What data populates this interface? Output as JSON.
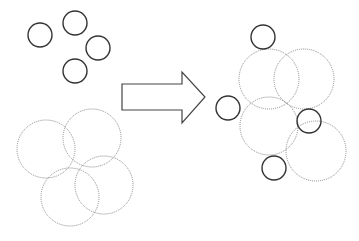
{
  "diagram": {
    "width": 359,
    "height": 241,
    "colors": {
      "background": "#ffffff",
      "solid_stroke": "#333333",
      "dotted_stroke": "#8a8a8a",
      "arrow_stroke": "#444444"
    },
    "left_group": {
      "small_circles": [
        {
          "cx": 40,
          "cy": 35,
          "r": 12
        },
        {
          "cx": 75,
          "cy": 23,
          "r": 12
        },
        {
          "cx": 98,
          "cy": 48,
          "r": 12
        },
        {
          "cx": 75,
          "cy": 71,
          "r": 12
        }
      ],
      "large_dotted_circles": [
        {
          "cx": 46,
          "cy": 149,
          "r": 29
        },
        {
          "cx": 92,
          "cy": 138,
          "r": 29
        },
        {
          "cx": 70,
          "cy": 197,
          "r": 29
        },
        {
          "cx": 104,
          "cy": 185,
          "r": 29
        }
      ]
    },
    "arrow": {
      "points": "122,84 182,84 182,72 205,97 182,123 182,110 122,110"
    },
    "right_group": {
      "small_circles": [
        {
          "cx": 263,
          "cy": 37,
          "r": 12
        },
        {
          "cx": 228,
          "cy": 108,
          "r": 12
        },
        {
          "cx": 309,
          "cy": 121,
          "r": 12
        },
        {
          "cx": 274,
          "cy": 168,
          "r": 12
        }
      ],
      "large_dotted_circles": [
        {
          "cx": 269,
          "cy": 79,
          "r": 30
        },
        {
          "cx": 304,
          "cy": 79,
          "r": 30
        },
        {
          "cx": 269,
          "cy": 126,
          "r": 29
        },
        {
          "cx": 316,
          "cy": 151,
          "r": 30
        }
      ]
    }
  }
}
